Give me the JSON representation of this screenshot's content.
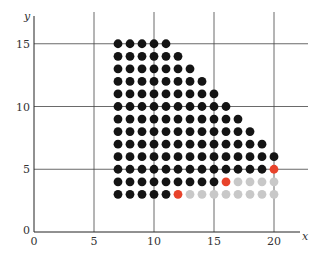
{
  "chart_data": {
    "type": "scatter",
    "title": "",
    "xlabel": "x",
    "ylabel": "y",
    "xlim": [
      0,
      22
    ],
    "ylim": [
      0,
      16
    ],
    "x_ticks": [
      "0",
      "5",
      "10",
      "15",
      "20"
    ],
    "y_ticks": [
      "0",
      "5",
      "10",
      "15"
    ],
    "grid": true,
    "colors": {
      "black": "#141414",
      "red": "#e8432b",
      "gray": "#c8c8c8"
    },
    "rows": [
      {
        "y": 15,
        "black": [
          7,
          11
        ]
      },
      {
        "y": 14,
        "black": [
          7,
          12
        ]
      },
      {
        "y": 13,
        "black": [
          7,
          13
        ]
      },
      {
        "y": 12,
        "black": [
          7,
          14
        ]
      },
      {
        "y": 11,
        "black": [
          7,
          15
        ]
      },
      {
        "y": 10,
        "black": [
          7,
          16
        ]
      },
      {
        "y": 9,
        "black": [
          7,
          17
        ]
      },
      {
        "y": 8,
        "black": [
          7,
          18
        ]
      },
      {
        "y": 7,
        "black": [
          7,
          19
        ]
      },
      {
        "y": 6,
        "black": [
          7,
          20
        ]
      },
      {
        "y": 5,
        "black": [
          7,
          19
        ],
        "red": [
          20
        ],
        "gray": []
      },
      {
        "y": 4,
        "black": [
          7,
          15
        ],
        "red": [
          16
        ],
        "gray": [
          17,
          20
        ]
      },
      {
        "y": 3,
        "black": [
          7,
          11
        ],
        "red": [
          12
        ],
        "gray": [
          13,
          20
        ]
      }
    ]
  }
}
